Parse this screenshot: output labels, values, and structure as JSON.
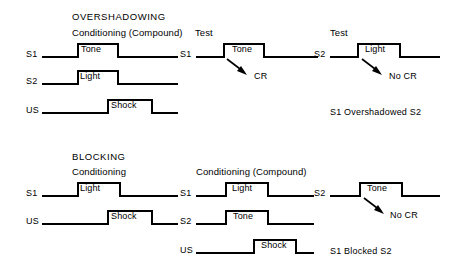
{
  "figure": {
    "type": "timing-diagram",
    "stroke_color": "#000000",
    "background_color": "#ffffff"
  },
  "sections": [
    {
      "id": "overshadowing",
      "title": "OVERSHADOWING",
      "panels": [
        {
          "id": "overshadowing-conditioning",
          "heading": "Conditioning (Compound)",
          "rows": [
            {
              "label": "S1",
              "pulse": "Tone"
            },
            {
              "label": "S2",
              "pulse": "Light"
            },
            {
              "label": "US",
              "pulse": "Shock"
            }
          ]
        },
        {
          "id": "overshadowing-test-s1",
          "heading": "Test",
          "rows": [
            {
              "label": "S1",
              "pulse": "Tone",
              "annotation": "CR"
            }
          ]
        },
        {
          "id": "overshadowing-test-s2",
          "heading": "Test",
          "rows": [
            {
              "label": "S2",
              "pulse": "Light",
              "annotation": "No CR"
            }
          ],
          "result": "S1 Overshadowed S2"
        }
      ]
    },
    {
      "id": "blocking",
      "title": "BLOCKING",
      "panels": [
        {
          "id": "blocking-conditioning",
          "heading": "Conditioning",
          "rows": [
            {
              "label": "S1",
              "pulse": "Light"
            },
            {
              "label": "US",
              "pulse": "Shock"
            }
          ]
        },
        {
          "id": "blocking-compound",
          "heading": "Conditioning (Compound)",
          "rows": [
            {
              "label": "S1",
              "pulse": "Light"
            },
            {
              "label": "S2",
              "pulse": "Tone"
            },
            {
              "label": "US",
              "pulse": "Shock"
            }
          ]
        },
        {
          "id": "blocking-test-s2",
          "heading": "",
          "rows": [
            {
              "label": "S2",
              "pulse": "Tone",
              "annotation": "No CR"
            }
          ],
          "result": "S1 Blocked S2"
        }
      ]
    }
  ],
  "labels": {
    "overshadowing_title": "OVERSHADOWING",
    "blocking_title": "BLOCKING",
    "conditioning_compound": "Conditioning (Compound)",
    "conditioning": "Conditioning",
    "test": "Test",
    "s1": "S1",
    "s2": "S2",
    "us": "US",
    "tone": "Tone",
    "light": "Light",
    "shock": "Shock",
    "cr": "CR",
    "no_cr": "No CR",
    "result_overshadow": "S1 Overshadowed S2",
    "result_blocked": "S1 Blocked S2"
  }
}
